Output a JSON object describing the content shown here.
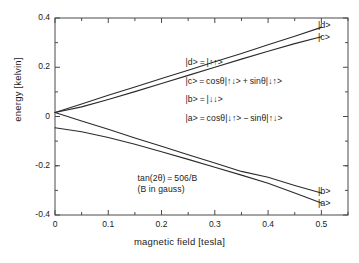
{
  "chart_data": {
    "type": "line",
    "title": "",
    "xlabel": "magnetic field [tesla]",
    "ylabel": "energy [kelvin]",
    "xlim": [
      0,
      0.55
    ],
    "ylim": [
      -0.4,
      0.4
    ],
    "xticks": [
      "0",
      "0.1",
      "0.2",
      "0.3",
      "0.4",
      "0.5"
    ],
    "xtick_values": [
      0,
      0.1,
      0.2,
      0.3,
      0.4,
      0.5
    ],
    "yticks": [
      "0.4",
      "0.2",
      "0",
      "-0.2",
      "-0.4"
    ],
    "ytick_values": [
      0.4,
      0.2,
      0,
      -0.2,
      -0.4
    ],
    "grid": false,
    "legend": "none",
    "minor_ticks": true,
    "x": [
      0,
      0.05,
      0.1,
      0.15,
      0.2,
      0.25,
      0.3,
      0.35,
      0.4,
      0.45,
      0.5
    ],
    "series": [
      {
        "name": "|d>",
        "label": "|d>",
        "color": "#2b2b2b",
        "values": [
          0.016,
          0.051,
          0.086,
          0.12,
          0.154,
          0.188,
          0.222,
          0.256,
          0.291,
          0.326,
          0.362
        ]
      },
      {
        "name": "|c>",
        "label": "|c>",
        "color": "#2b2b2b",
        "values": [
          0.016,
          0.039,
          0.069,
          0.101,
          0.134,
          0.167,
          0.2,
          0.233,
          0.265,
          0.296,
          0.324
        ]
      },
      {
        "name": "|b>",
        "label": "|b>",
        "color": "#2b2b2b",
        "values": [
          0.016,
          -0.018,
          -0.052,
          -0.087,
          -0.121,
          -0.155,
          -0.189,
          -0.223,
          -0.247,
          -0.28,
          -0.311
        ]
      },
      {
        "name": "|a>",
        "label": "|a>",
        "color": "#2b2b2b",
        "values": [
          -0.046,
          -0.062,
          -0.085,
          -0.113,
          -0.143,
          -0.174,
          -0.206,
          -0.238,
          -0.271,
          -0.311,
          -0.351
        ]
      }
    ],
    "annotations": [
      {
        "name": "eq-d",
        "text": "|d> = |↑↑>",
        "x": 0.245,
        "y": 0.218
      },
      {
        "name": "eq-c",
        "text": "|c> = cosθ|↑↓> + sinθ|↓↑>",
        "x": 0.245,
        "y": 0.142
      },
      {
        "name": "eq-b",
        "text": "|b> = |↓↓>",
        "x": 0.245,
        "y": 0.066
      },
      {
        "name": "eq-a",
        "text": "|a> = cosθ|↓↑> − sinθ|↑↓>",
        "x": 0.245,
        "y": -0.01
      },
      {
        "name": "tan-formula",
        "text": "tan(2θ) = 506/B",
        "x": 0.155,
        "y": -0.255
      },
      {
        "name": "gauss-note",
        "text": "(B in gauss)",
        "x": 0.155,
        "y": -0.3
      }
    ]
  },
  "axes": {
    "xlabel": "magnetic field [tesla]",
    "ylabel": "energy [kelvin]"
  },
  "curve_labels": {
    "d": "|d>",
    "c": "|c>",
    "b": "|b>",
    "a": "|a>"
  },
  "colors": {
    "line": "#2b2b2b",
    "frame": "#4a4a4a",
    "text": "#1a1a1a",
    "background": "#ffffff"
  }
}
